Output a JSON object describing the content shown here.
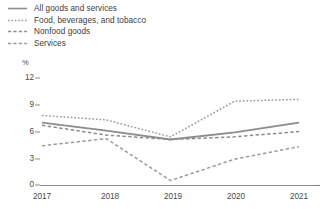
{
  "chart_data": {
    "type": "line",
    "title": "",
    "xlabel": "",
    "ylabel": "%",
    "x": [
      "2017",
      "2018",
      "2019",
      "2020",
      "2021"
    ],
    "categories": [
      "2017",
      "2018",
      "2019",
      "2020",
      "2021"
    ],
    "ylim": [
      0,
      12
    ],
    "yticks": [
      0,
      3,
      6,
      9,
      12
    ],
    "grid": false,
    "legend_position": "top-left",
    "series": [
      {
        "name": "All goods and services",
        "style": "solid",
        "color": "#8c8c8c",
        "values": [
          7.0,
          6.1,
          5.1,
          5.9,
          7.0
        ]
      },
      {
        "name": "Food, beverages, and tobacco",
        "style": "dotted",
        "color": "#9a9a9a",
        "values": [
          7.8,
          7.3,
          5.4,
          9.4,
          9.6
        ]
      },
      {
        "name": "Nonfood goods",
        "style": "dashed",
        "color": "#8c8c8c",
        "values": [
          6.7,
          5.6,
          5.1,
          5.4,
          6.0
        ]
      },
      {
        "name": "Services",
        "style": "dashed",
        "color": "#9a9a9a",
        "values": [
          4.4,
          5.2,
          0.5,
          2.9,
          4.3
        ]
      }
    ]
  },
  "legend": {
    "items": [
      {
        "label": "All goods and services"
      },
      {
        "label": "Food, beverages, and tobacco"
      },
      {
        "label": "Nonfood goods"
      },
      {
        "label": "Services"
      }
    ]
  },
  "axes": {
    "y_unit": "%",
    "y_labels": [
      "12",
      "9",
      "6",
      "3",
      "0"
    ],
    "x_labels": [
      "2017",
      "2018",
      "2019",
      "2020",
      "2021"
    ]
  },
  "colors": {
    "line_primary": "#8c8c8c",
    "line_secondary": "#9a9a9a",
    "axis": "#8a8a8a",
    "text": "#4a4a4a"
  }
}
